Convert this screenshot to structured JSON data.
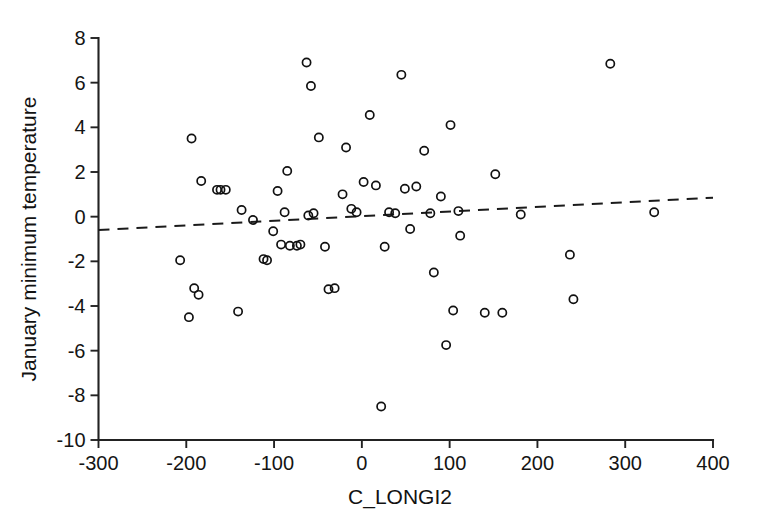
{
  "chart_data": {
    "type": "scatter",
    "title": "",
    "xlabel": "C_LONGI2",
    "ylabel": "January minimum temperature",
    "xlim": [
      -300,
      400
    ],
    "ylim": [
      -10,
      8
    ],
    "xticks": [
      -300,
      -200,
      -100,
      0,
      100,
      200,
      300,
      400
    ],
    "yticks": [
      -10,
      -8,
      -6,
      -4,
      -2,
      0,
      2,
      4,
      6,
      8
    ],
    "xtick_labels": [
      "-300",
      "-200",
      "-100",
      "0",
      "100",
      "200",
      "300",
      "400"
    ],
    "ytick_labels": [
      "-10",
      "-8",
      "-6",
      "-4",
      "-2",
      "0",
      "2",
      "4",
      "6",
      "8"
    ],
    "grid": false,
    "legend": null,
    "marker": "open-circle",
    "marker_color": "#111111",
    "series": [
      {
        "name": "observations",
        "points": [
          [
            -207,
            -1.95
          ],
          [
            -197,
            -4.5
          ],
          [
            -194,
            3.5
          ],
          [
            -191,
            -3.2
          ],
          [
            -186,
            -3.5
          ],
          [
            -183,
            1.6
          ],
          [
            -165,
            1.2
          ],
          [
            -161,
            1.2
          ],
          [
            -155,
            1.2
          ],
          [
            -141,
            -4.25
          ],
          [
            -137,
            0.3
          ],
          [
            -124,
            -0.15
          ],
          [
            -112,
            -1.9
          ],
          [
            -108,
            -1.95
          ],
          [
            -101,
            -0.65
          ],
          [
            -96,
            1.15
          ],
          [
            -92,
            -1.25
          ],
          [
            -88,
            0.2
          ],
          [
            -85,
            2.05
          ],
          [
            -82,
            -1.3
          ],
          [
            -74,
            -1.3
          ],
          [
            -70,
            -1.25
          ],
          [
            -63,
            6.9
          ],
          [
            -61,
            0.05
          ],
          [
            -58,
            5.85
          ],
          [
            -55,
            0.15
          ],
          [
            -49,
            3.55
          ],
          [
            -42,
            -1.35
          ],
          [
            -38,
            -3.25
          ],
          [
            -31,
            -3.2
          ],
          [
            -22,
            1.0
          ],
          [
            -18,
            3.1
          ],
          [
            -12,
            0.35
          ],
          [
            -6,
            0.2
          ],
          [
            2,
            1.55
          ],
          [
            9,
            4.55
          ],
          [
            16,
            1.4
          ],
          [
            22,
            -8.5
          ],
          [
            26,
            -1.35
          ],
          [
            31,
            0.2
          ],
          [
            38,
            0.15
          ],
          [
            45,
            6.35
          ],
          [
            49,
            1.25
          ],
          [
            55,
            -0.55
          ],
          [
            62,
            1.35
          ],
          [
            71,
            2.95
          ],
          [
            78,
            0.15
          ],
          [
            82,
            -2.5
          ],
          [
            90,
            0.9
          ],
          [
            96,
            -5.75
          ],
          [
            101,
            4.1
          ],
          [
            104,
            -4.2
          ],
          [
            110,
            0.25
          ],
          [
            112,
            -0.85
          ],
          [
            140,
            -4.3
          ],
          [
            152,
            1.9
          ],
          [
            160,
            -4.3
          ],
          [
            181,
            0.1
          ],
          [
            237,
            -1.7
          ],
          [
            241,
            -3.7
          ],
          [
            283,
            6.85
          ],
          [
            333,
            0.2
          ]
        ]
      }
    ],
    "trend_line": {
      "style": "dashed",
      "x": [
        -300,
        400
      ],
      "y": [
        -0.6,
        0.85
      ]
    }
  },
  "axes": {
    "x_title": "C_LONGI2",
    "y_title": "January minimum temperature"
  }
}
